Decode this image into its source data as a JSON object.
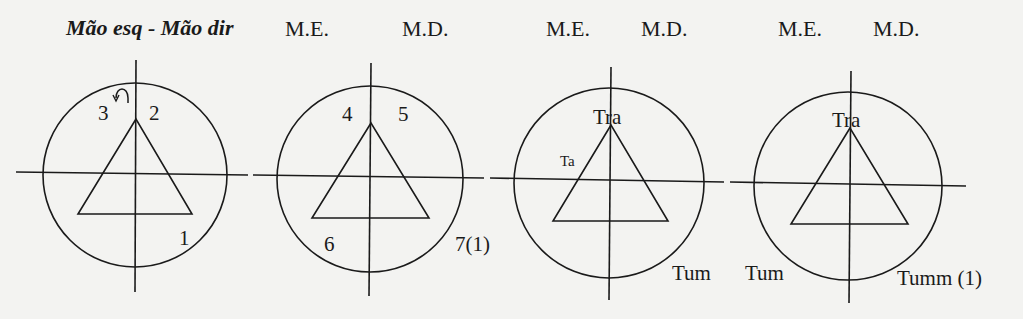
{
  "title": "Mão esq - Mão dir",
  "colors": {
    "ink": "#1a1a1a",
    "paper": "#f3f3f1"
  },
  "diagrams": [
    {
      "header_left": "",
      "header_right": "",
      "labels": {
        "top_left": "3",
        "top_left_icon": "counterclockwise-arrow",
        "top_right": "2",
        "bottom_right": "1"
      }
    },
    {
      "header_left": "M.E.",
      "header_right": "M.D.",
      "labels": {
        "top_left": "4",
        "top_right": "5",
        "bottom_left": "6",
        "bottom_right": "7(1)"
      }
    },
    {
      "header_left": "M.E.",
      "header_right": "M.D.",
      "labels": {
        "apex": "Tra",
        "left_side": "Ta",
        "bottom_right": "Tum"
      }
    },
    {
      "header_left": "M.E.",
      "header_right": "M.D.",
      "labels": {
        "apex": "Tra",
        "bottom_left": "Tum",
        "bottom_right": "Tumm (1)"
      }
    }
  ]
}
